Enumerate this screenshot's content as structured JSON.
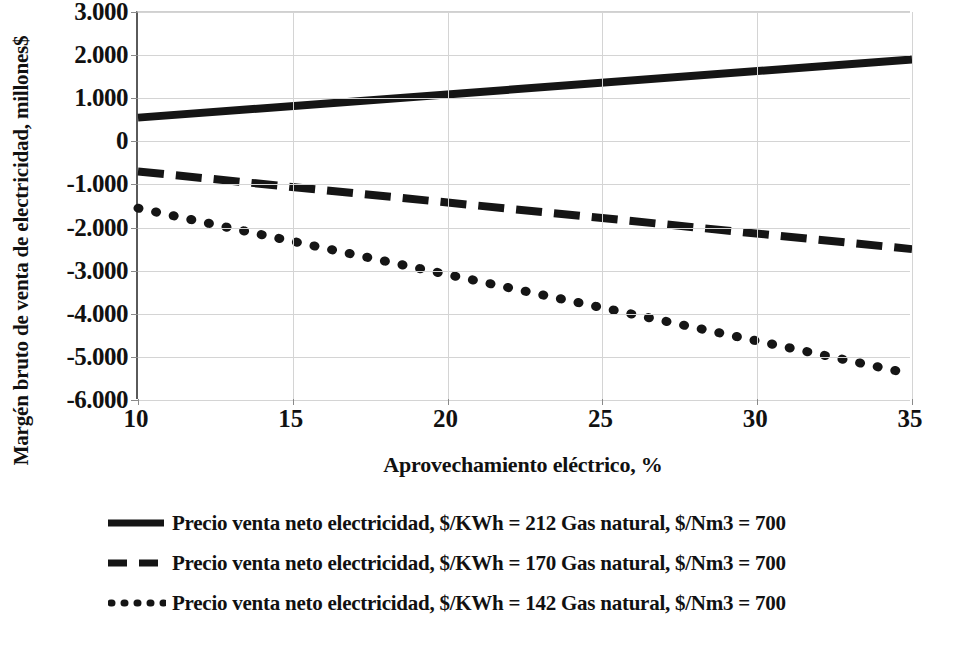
{
  "chart_data": {
    "type": "line",
    "title": "",
    "xlabel": "Aprovechamiento eléctrico, %",
    "ylabel": "Margén bruto de venta de electricidad, millones$",
    "xlim": [
      10,
      35
    ],
    "ylim": [
      -6000,
      3000
    ],
    "xticks": [
      "10",
      "15",
      "20",
      "25",
      "30",
      "35"
    ],
    "xtick_values": [
      10,
      15,
      20,
      25,
      30,
      35
    ],
    "yticks": [
      "3.000",
      "2.000",
      "1.000",
      "0",
      "-1.000",
      "-2.000",
      "-3.000",
      "-4.000",
      "-5.000",
      "-6.000"
    ],
    "ytick_values": [
      3000,
      2000,
      1000,
      0,
      -1000,
      -2000,
      -3000,
      -4000,
      -5000,
      -6000
    ],
    "grid": true,
    "legend_position": "bottom",
    "line_color": "#151515",
    "grid_color": "#d4d4d4",
    "axis_color": "#5a5a5a",
    "x": [
      10,
      35
    ],
    "series": [
      {
        "name": "Precio venta neto electricidad, $/KWh = 212 Gas natural, $/Nm3 =  700",
        "style": "solid",
        "price": "212",
        "gas": "700",
        "values": [
          550,
          1900
        ]
      },
      {
        "name": "Precio venta neto electricidad, $/KWh = 170 Gas natural, $/Nm3 =  700",
        "style": "dashed",
        "price": "170",
        "gas": "700",
        "values": [
          -700,
          -2500
        ]
      },
      {
        "name": "Precio venta neto electricidad, $/KWh = 142 Gas natural, $/Nm3 =  700",
        "style": "dotted",
        "price": "142",
        "gas": "700",
        "values": [
          -1550,
          -5400
        ]
      }
    ]
  }
}
